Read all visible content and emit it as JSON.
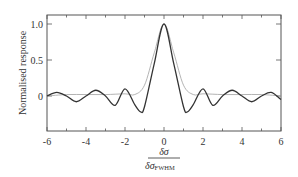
{
  "chart_data": {
    "type": "line",
    "title": "",
    "xlabel": "δσ / δσ_FWHM",
    "xlabel_numerator": "δσ",
    "xlabel_denominator": "δσ",
    "xlabel_denominator_sub": "FWHM",
    "ylabel": "Normalised response",
    "xlim": [
      -6,
      6
    ],
    "ylim": [
      -0.45,
      1.1
    ],
    "xticks": [
      -6,
      -4,
      -2,
      0,
      2,
      4,
      6
    ],
    "xtick_labels": [
      "-6",
      "-4",
      "-2",
      "0",
      "2",
      "4",
      "6"
    ],
    "yticks": [
      0,
      0.5,
      1.0
    ],
    "ytick_labels": [
      "0",
      "0.5",
      "1.0"
    ],
    "grid": false,
    "legend": null,
    "series": [
      {
        "name": "sinc response (dark)",
        "color": "#333333",
        "x": [
          -6,
          -5.5,
          -5,
          -4.5,
          -4,
          -3.5,
          -3,
          -2.5,
          -2,
          -1.5,
          -1.2,
          -1,
          -0.5,
          0,
          0.5,
          1,
          1.2,
          1.5,
          2,
          2.5,
          3,
          3.5,
          4,
          4.5,
          5,
          5.5,
          6
        ],
        "values": [
          0,
          0.05,
          0.0,
          -0.08,
          0.0,
          0.08,
          0.0,
          -0.13,
          0.1,
          -0.12,
          -0.22,
          -0.15,
          0.45,
          1.0,
          0.45,
          -0.15,
          -0.22,
          -0.12,
          0.1,
          -0.13,
          0.0,
          0.08,
          0.0,
          -0.08,
          0.0,
          0.05,
          -0.05
        ]
      },
      {
        "name": "gaussian-like response (light)",
        "color": "#aaaaaa",
        "x": [
          -6,
          -5,
          -4,
          -3,
          -2,
          -1.5,
          -1,
          -0.5,
          0,
          0.5,
          1,
          1.5,
          2,
          3,
          4,
          5,
          6
        ],
        "values": [
          0,
          0.02,
          0.02,
          0.02,
          0.03,
          0.02,
          0.15,
          0.6,
          1.0,
          0.6,
          0.15,
          0.02,
          0.03,
          0.02,
          0.02,
          0.02,
          0
        ]
      }
    ]
  }
}
